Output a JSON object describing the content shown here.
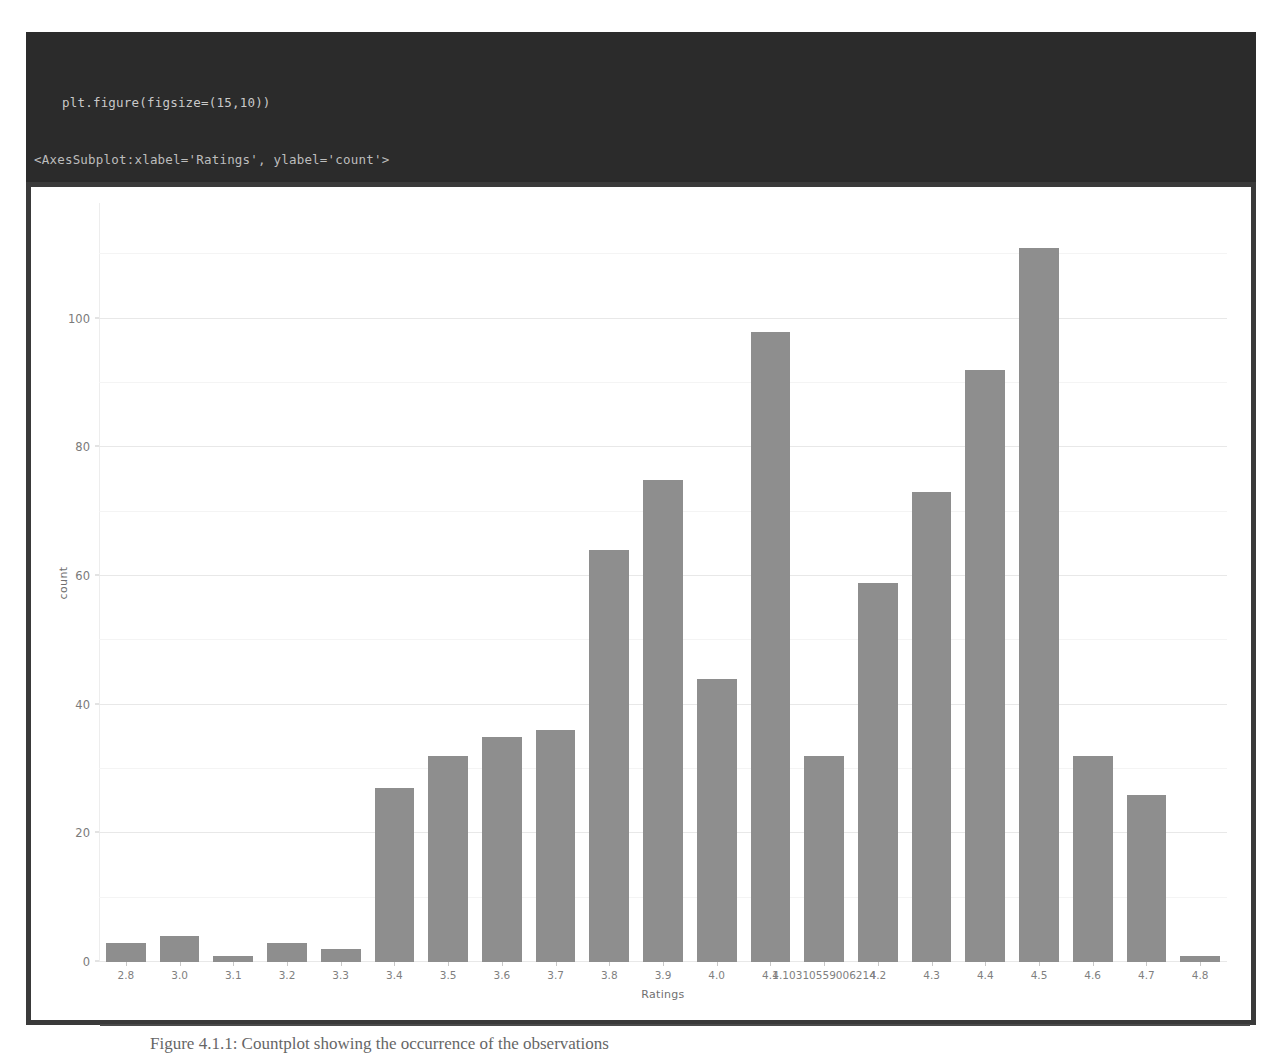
{
  "notebook": {
    "code_lines": [
      "plt.figure(figsize=(15,10))",
      "sns.set_style('whitegrid')",
      "sns.countplot(x='Ratings',data=df)"
    ],
    "output_text": "<AxesSubplot:xlabel='Ratings', ylabel='count'>"
  },
  "caption": {
    "text": "Figure 4.1.1: Countplot showing the occurrence of the observations"
  },
  "colors": {
    "code_background": "#2b2b2b",
    "code_text": "#c9c9c9",
    "figure_border": "#3a3a3a",
    "bar_fill": "#8e8e8e",
    "grid": "#e8e8e8",
    "tick_text": "#7a7a7a"
  },
  "chart_data": {
    "type": "bar",
    "title": "",
    "xlabel": "Ratings",
    "ylabel": "count",
    "ylim": [
      0,
      118
    ],
    "yticks": [
      0,
      20,
      40,
      60,
      80,
      100
    ],
    "grid": true,
    "legend": null,
    "categories": [
      "2.8",
      "3.0",
      "3.1",
      "3.2",
      "3.3",
      "3.4",
      "3.5",
      "3.6",
      "3.7",
      "3.8",
      "3.9",
      "4.0",
      "4.1",
      "4.10310559006214",
      "4.2",
      "4.3",
      "4.4",
      "4.5",
      "4.6",
      "4.7",
      "4.8"
    ],
    "values": [
      3,
      4,
      1,
      3,
      2,
      27,
      32,
      35,
      36,
      64,
      75,
      44,
      98,
      32,
      59,
      73,
      92,
      111,
      32,
      26,
      1
    ]
  }
}
